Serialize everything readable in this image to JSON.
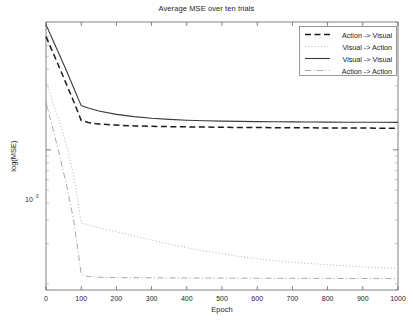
{
  "chart_data": {
    "type": "line",
    "title": "Average MSE over ten trials",
    "xlabel": "Epoch",
    "ylabel": "log(MSE)",
    "yscale": "log",
    "xlim": [
      0,
      1000
    ],
    "ylim": [
      0.09,
      9.0
    ],
    "grid": false,
    "legend_position": "top-right",
    "xticks": [
      0,
      100,
      200,
      300,
      400,
      500,
      600,
      700,
      800,
      900,
      1000
    ],
    "xtick_labels": [
      "0",
      "100",
      "200",
      "300",
      "400",
      "500",
      "600",
      "700",
      "800",
      "900",
      "1000"
    ],
    "ytick_labels": [
      "10^0"
    ],
    "ytick_mantissa": "10",
    "ytick_exponent": "0",
    "ytick_values": [
      1
    ],
    "x": [
      0,
      20,
      40,
      60,
      80,
      100,
      120,
      150,
      200,
      250,
      300,
      350,
      400,
      450,
      500,
      550,
      600,
      650,
      700,
      750,
      800,
      850,
      900,
      950,
      1000
    ],
    "series": [
      {
        "name": "Action -> Visual",
        "style": "dashed",
        "color": "#1a1a1a",
        "values": [
          7.0,
          5.3,
          4.0,
          3.0,
          2.25,
          1.66,
          1.6,
          1.56,
          1.53,
          1.51,
          1.5,
          1.49,
          1.485,
          1.48,
          1.475,
          1.47,
          1.468,
          1.465,
          1.462,
          1.46,
          1.458,
          1.456,
          1.454,
          1.452,
          1.45
        ]
      },
      {
        "name": "Visual -> Action",
        "style": "dotted",
        "color": "#b4b4b4",
        "values": [
          3.3,
          2.25,
          1.55,
          1.05,
          0.62,
          0.285,
          0.275,
          0.262,
          0.245,
          0.228,
          0.212,
          0.198,
          0.186,
          0.176,
          0.168,
          0.16,
          0.154,
          0.149,
          0.145,
          0.142,
          0.139,
          0.136,
          0.134,
          0.132,
          0.13
        ]
      },
      {
        "name": "Visual -> Visual",
        "style": "solid",
        "color": "#3a3a3a",
        "values": [
          8.6,
          6.55,
          5.0,
          3.8,
          2.85,
          2.14,
          2.05,
          1.95,
          1.84,
          1.77,
          1.72,
          1.69,
          1.665,
          1.65,
          1.64,
          1.632,
          1.626,
          1.621,
          1.617,
          1.614,
          1.611,
          1.609,
          1.607,
          1.606,
          1.605
        ]
      },
      {
        "name": "Action -> Action",
        "style": "dashdot",
        "color": "#9a9a9a",
        "values": [
          2.25,
          1.42,
          0.88,
          0.52,
          0.285,
          0.118,
          0.1135,
          0.112,
          0.1115,
          0.1112,
          0.111,
          0.1108,
          0.1106,
          0.1105,
          0.1104,
          0.1103,
          0.1102,
          0.1101,
          0.11,
          0.1099,
          0.1098,
          0.1097,
          0.1096,
          0.1095,
          0.1094
        ]
      }
    ]
  },
  "legend": {
    "items": [
      {
        "label": "Action -> Visual"
      },
      {
        "label": "Visual -> Action"
      },
      {
        "label": "Visual -> Visual"
      },
      {
        "label": "Action -> Action"
      }
    ]
  }
}
